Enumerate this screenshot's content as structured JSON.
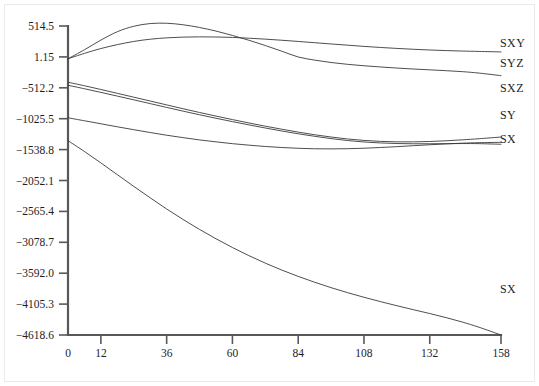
{
  "chart_data": {
    "type": "line",
    "title": "",
    "xlabel": "",
    "ylabel": "",
    "grid": false,
    "legend_position": "right-inline",
    "xlim": [
      0,
      158
    ],
    "ylim": [
      -4618.6,
      514.5
    ],
    "xticks": [
      0,
      12,
      36,
      60,
      84,
      108,
      132,
      158
    ],
    "xtick_labels": [
      "0",
      "12",
      "36",
      "60",
      "84",
      "108",
      "132",
      "158"
    ],
    "yticks": [
      514.5,
      1.15,
      -512.2,
      -1025.5,
      -1538.8,
      -2052.1,
      -2565.4,
      -3078.7,
      -3592.0,
      -4105.3,
      -4618.6
    ],
    "ytick_labels": [
      "514.5",
      "1.15",
      "−512.2",
      "−1025.5",
      "−1538.8",
      "−2052.1",
      "−2565.4",
      "−3078.7",
      "−3592.0",
      "−4105.3",
      "−4618.6"
    ],
    "line_color": "#3a3a3c",
    "axis_color": "#58585a",
    "series": [
      {
        "name": "SXY",
        "label": "SXY",
        "label_y": 60,
        "x": [
          0,
          6,
          12,
          18,
          24,
          30,
          36,
          42,
          48,
          54,
          60,
          66,
          72,
          78,
          84,
          90,
          96,
          102,
          108,
          114,
          120,
          126,
          132,
          138,
          144,
          150,
          158
        ],
        "values": [
          -30,
          60,
          140,
          205,
          258,
          295,
          318,
          330,
          334,
          332,
          325,
          312,
          296,
          278,
          258,
          237,
          216,
          196,
          176,
          158,
          142,
          128,
          116,
          106,
          98,
          92,
          84
        ]
      },
      {
        "name": "SYZ",
        "label": "SYZ",
        "label_y": 110,
        "x": [
          0,
          6,
          12,
          18,
          24,
          30,
          36,
          42,
          48,
          54,
          60,
          66,
          72,
          78,
          84,
          90,
          96,
          102,
          108,
          114,
          120,
          126,
          132,
          138,
          144,
          150,
          158
        ],
        "values": [
          -30,
          120,
          280,
          420,
          510,
          555,
          560,
          535,
          490,
          430,
          358,
          278,
          190,
          96,
          0,
          -52,
          -92,
          -122,
          -146,
          -166,
          -184,
          -200,
          -214,
          -228,
          -244,
          -268,
          -310
        ]
      },
      {
        "name": "SXZ",
        "label": "SXZ",
        "label_y": 160,
        "x": [
          0,
          6,
          12,
          18,
          24,
          30,
          36,
          42,
          48,
          54,
          60,
          66,
          72,
          78,
          84,
          90,
          96,
          102,
          108,
          114,
          120,
          126,
          132,
          138,
          144,
          150,
          158
        ],
        "values": [
          -1010,
          -1060,
          -1110,
          -1160,
          -1208,
          -1255,
          -1300,
          -1340,
          -1378,
          -1410,
          -1440,
          -1465,
          -1487,
          -1504,
          -1517,
          -1525,
          -1527,
          -1524,
          -1516,
          -1504,
          -1490,
          -1474,
          -1458,
          -1444,
          -1432,
          -1424,
          -1418
        ]
      },
      {
        "name": "SY",
        "label": "SY",
        "label_y": 205,
        "x": [
          0,
          6,
          12,
          18,
          24,
          30,
          36,
          42,
          48,
          54,
          60,
          66,
          72,
          78,
          84,
          90,
          96,
          102,
          108,
          114,
          120,
          126,
          132,
          138,
          144,
          150,
          158
        ],
        "values": [
          -420,
          -478,
          -540,
          -604,
          -668,
          -732,
          -796,
          -860,
          -922,
          -982,
          -1040,
          -1096,
          -1150,
          -1200,
          -1248,
          -1292,
          -1330,
          -1362,
          -1386,
          -1402,
          -1410,
          -1410,
          -1404,
          -1392,
          -1376,
          -1358,
          -1330
        ]
      },
      {
        "name": "SX-upper",
        "label": "SX",
        "label_y": 253,
        "x": [
          0,
          6,
          12,
          18,
          24,
          30,
          36,
          42,
          48,
          54,
          60,
          66,
          72,
          78,
          84,
          90,
          96,
          102,
          108,
          114,
          120,
          126,
          132,
          138,
          144,
          150,
          158
        ],
        "values": [
          -470,
          -528,
          -588,
          -650,
          -712,
          -775,
          -838,
          -900,
          -960,
          -1018,
          -1074,
          -1128,
          -1180,
          -1230,
          -1276,
          -1318,
          -1356,
          -1388,
          -1412,
          -1428,
          -1438,
          -1442,
          -1442,
          -1440,
          -1438,
          -1440,
          -1450
        ]
      },
      {
        "name": "SX",
        "label": "SX",
        "label_y": 860,
        "x": [
          0,
          6,
          12,
          18,
          24,
          30,
          36,
          42,
          48,
          54,
          60,
          66,
          72,
          78,
          84,
          90,
          96,
          102,
          108,
          114,
          120,
          126,
          132,
          138,
          144,
          150,
          158
        ],
        "values": [
          -1390,
          -1570,
          -1760,
          -1955,
          -2150,
          -2340,
          -2525,
          -2700,
          -2865,
          -3020,
          -3165,
          -3300,
          -3425,
          -3540,
          -3645,
          -3742,
          -3832,
          -3915,
          -3992,
          -4064,
          -4132,
          -4198,
          -4262,
          -4330,
          -4405,
          -4490,
          -4618
        ]
      }
    ],
    "series_labels": [
      {
        "text": "SXY",
        "x": 500,
        "y": 47
      },
      {
        "text": "SYZ",
        "x": 500,
        "y": 67
      },
      {
        "text": "SXZ",
        "x": 500,
        "y": 92
      },
      {
        "text": "SY",
        "x": 500,
        "y": 119
      },
      {
        "text": "SX",
        "x": 500,
        "y": 143
      },
      {
        "text": "SX",
        "x": 500,
        "y": 293
      }
    ]
  }
}
